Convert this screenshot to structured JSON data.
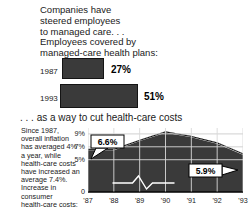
{
  "top_section": {
    "headline_lines": [
      "Companies have",
      "steered employees",
      "to managed care. . .",
      "Employees covered by",
      "managed-care health plans:"
    ],
    "bars": [
      {
        "label": "1987",
        "value_label": "27%",
        "value": 27
      },
      {
        "label": "1993",
        "value_label": "51%",
        "value": 51
      }
    ]
  },
  "bottom_section": {
    "headline": ". . . as a way to cut health-care costs",
    "note_lines": [
      "Since 1987,",
      "overall inflation",
      "has averaged 4%",
      "a year, while",
      "health-care costs",
      "have increased an",
      "average 7.4%.",
      "Increase in",
      "consumer",
      "health-care costs:"
    ]
  },
  "chart_data": {
    "type": "area",
    "title": ". . . as a way to cut health-care costs",
    "xlabel": "",
    "ylabel": "",
    "x": [
      "'87",
      "'88",
      "'89",
      "'90",
      "'91",
      "'92",
      "'93"
    ],
    "values": [
      6.6,
      6.6,
      8.0,
      9.3,
      8.6,
      7.6,
      5.9
    ],
    "ytick_labels": [
      "9%",
      "7%",
      "5%",
      "0"
    ],
    "ytick_values": [
      9,
      7,
      5,
      0
    ],
    "ylim": [
      0,
      10
    ],
    "grid": true,
    "axis_break": true,
    "annotations": [
      {
        "label": "6.6%",
        "x": "'87",
        "value": 6.6
      },
      {
        "label": "5.9%",
        "x": "'93",
        "value": 5.9
      }
    ],
    "colors": {
      "area_fill": "#3a3a3a",
      "area_outline": "#111111",
      "grid": "#e8e8e8",
      "callout_fill": "#ffffff"
    }
  }
}
